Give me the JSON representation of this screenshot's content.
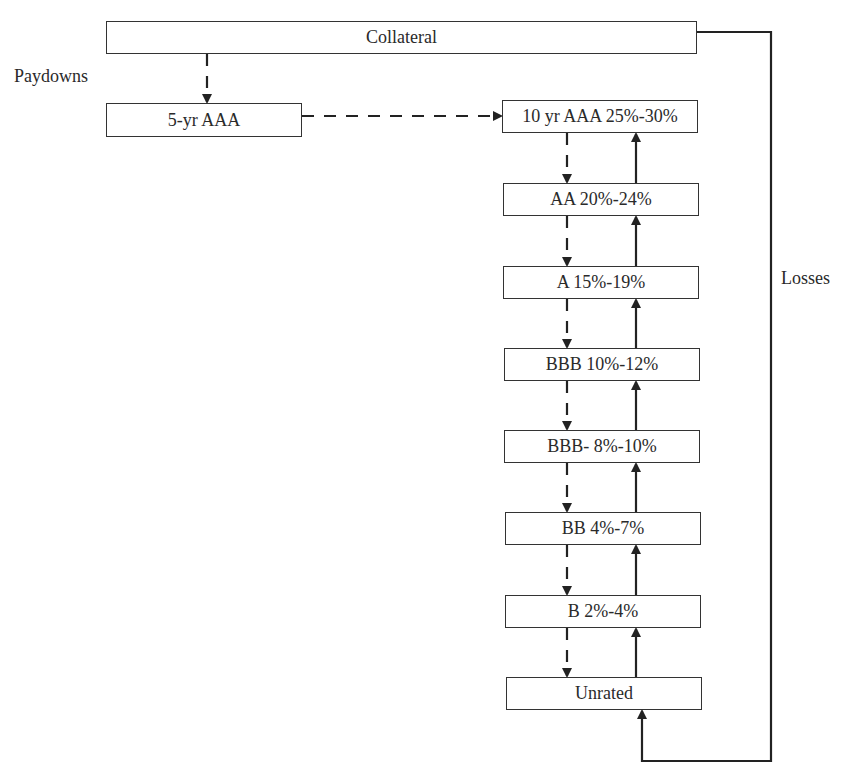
{
  "diagram": {
    "collateral": "Collateral",
    "short_tranche": "5-yr AAA",
    "paydowns_label": "Paydowns",
    "losses_label": "Losses",
    "tranches": [
      {
        "label": "10 yr AAA 25%-30%"
      },
      {
        "label": "AA 20%-24%"
      },
      {
        "label": "A 15%-19%"
      },
      {
        "label": "BBB 10%-12%"
      },
      {
        "label": "BBB- 8%-10%"
      },
      {
        "label": "BB 4%-7%"
      },
      {
        "label": "B 2%-4%"
      },
      {
        "label": "Unrated"
      }
    ],
    "flows": {
      "paydowns": "dashed, top-down from Collateral to 5-yr AAA, then to 10 yr AAA and down the stack",
      "losses": "solid, from Collateral around to Unrated and up the stack"
    }
  }
}
